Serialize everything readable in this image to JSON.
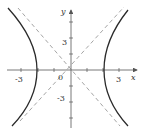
{
  "figure": {
    "type": "hyperbola-graph",
    "equation_hint": "x^2/4 - y^2/4 = 1",
    "axes": {
      "x_label": "x",
      "y_label": "y",
      "origin_label": "0",
      "x_ticks": [
        "-3",
        "3"
      ],
      "y_ticks": [
        "3",
        "-3"
      ]
    },
    "curves": [
      {
        "name": "right-branch",
        "style": "solid"
      },
      {
        "name": "left-branch",
        "style": "solid"
      }
    ],
    "asymptotes": [
      {
        "name": "y = x",
        "style": "dashed"
      },
      {
        "name": "y = -x",
        "style": "dashed"
      }
    ],
    "colors": {
      "curve": "#2a2a2a",
      "asymptote": "#9a9a9a",
      "axis": "#555555"
    }
  }
}
